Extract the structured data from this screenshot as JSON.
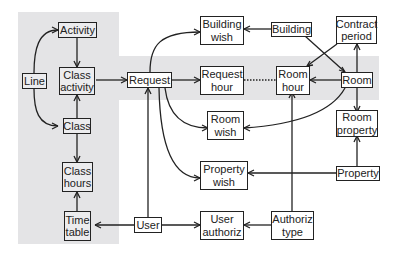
{
  "diagram": {
    "type": "entity-relationship",
    "entities": [
      {
        "id": "activity",
        "label": "Activity"
      },
      {
        "id": "line",
        "label": "Line"
      },
      {
        "id": "class_activity",
        "label": "Class\nactivity"
      },
      {
        "id": "class",
        "label": "Class"
      },
      {
        "id": "class_hours",
        "label": "Class\nhours"
      },
      {
        "id": "time_table",
        "label": "Time\ntable"
      },
      {
        "id": "request",
        "label": "Request"
      },
      {
        "id": "building_wish",
        "label": "Building\nwish"
      },
      {
        "id": "request_hour",
        "label": "Request\nhour"
      },
      {
        "id": "room_wish",
        "label": "Room\nwish"
      },
      {
        "id": "property_wish",
        "label": "Property\nwish"
      },
      {
        "id": "user",
        "label": "User"
      },
      {
        "id": "user_authoriz",
        "label": "User\nauthoriz"
      },
      {
        "id": "building",
        "label": "Building"
      },
      {
        "id": "room_hour",
        "label": "Room\nhour"
      },
      {
        "id": "authoriz_type",
        "label": "Authoriz\ntype"
      },
      {
        "id": "contract_period",
        "label": "Contract\nperiod"
      },
      {
        "id": "room",
        "label": "Room"
      },
      {
        "id": "room_property",
        "label": "Room\nproperty"
      },
      {
        "id": "property",
        "label": "Property"
      }
    ],
    "relationships": [
      {
        "from": "line",
        "to": "activity",
        "many_end": "activity"
      },
      {
        "from": "line",
        "to": "class",
        "many_end": "class"
      },
      {
        "from": "activity",
        "to": "class_activity",
        "many_end": "class_activity"
      },
      {
        "from": "class",
        "to": "class_activity",
        "many_end": "class_activity"
      },
      {
        "from": "class",
        "to": "class_hours",
        "many_end": "class_hours"
      },
      {
        "from": "time_table",
        "to": "class_hours",
        "many_end": "class_hours"
      },
      {
        "from": "class_activity",
        "to": "request",
        "many_end": "request"
      },
      {
        "from": "request",
        "to": "building_wish",
        "many_end": "building_wish"
      },
      {
        "from": "request",
        "to": "request_hour",
        "many_end": "request_hour"
      },
      {
        "from": "request",
        "to": "room_wish",
        "many_end": "room_wish"
      },
      {
        "from": "request",
        "to": "property_wish",
        "many_end": "property_wish"
      },
      {
        "from": "user",
        "to": "request",
        "many_end": "request"
      },
      {
        "from": "user",
        "to": "time_table",
        "many_end": "time_table"
      },
      {
        "from": "user",
        "to": "user_authoriz",
        "many_end": "user_authoriz"
      },
      {
        "from": "building",
        "to": "building_wish",
        "many_end": "building_wish"
      },
      {
        "from": "building",
        "to": "room",
        "many_end": "room"
      },
      {
        "from": "request_hour",
        "to": "room_hour",
        "style": "dotted"
      },
      {
        "from": "room",
        "to": "room_hour",
        "many_end": "room_hour"
      },
      {
        "from": "contract_period",
        "to": "room_hour",
        "many_end": "room_hour"
      },
      {
        "from": "contract_period",
        "to": "room",
        "many_end": "room"
      },
      {
        "from": "room",
        "to": "room_wish",
        "many_end": "room_wish"
      },
      {
        "from": "room",
        "to": "room_property",
        "many_end": "room_property"
      },
      {
        "from": "property",
        "to": "room_property",
        "many_end": "room_property"
      },
      {
        "from": "property",
        "to": "property_wish",
        "many_end": "property_wish"
      },
      {
        "from": "authoriz_type",
        "to": "room_hour",
        "many_end": "room_hour"
      },
      {
        "from": "authoriz_type",
        "to": "user_authoriz",
        "many_end": "user_authoriz"
      }
    ]
  },
  "colors": {
    "shade": "#e4e4e6",
    "line": "#222222",
    "box_bg": "#ffffff"
  }
}
